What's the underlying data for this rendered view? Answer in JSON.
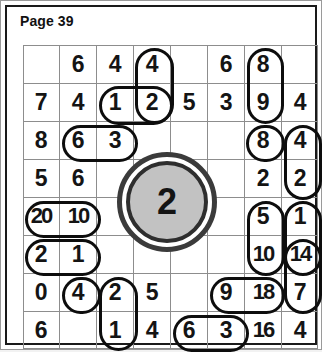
{
  "page": {
    "title": "Page 39"
  },
  "grid": {
    "rows": 8,
    "columns": 8,
    "cells": [
      [
        "",
        "6",
        "4",
        "4",
        "",
        "6",
        "8",
        ""
      ],
      [
        "7",
        "4",
        "1",
        "2",
        "5",
        "3",
        "9",
        "4"
      ],
      [
        "8",
        "6",
        "3",
        "",
        "",
        "",
        "8",
        "4"
      ],
      [
        "5",
        "6",
        "",
        "",
        "",
        "",
        "2",
        "2"
      ],
      [
        "20",
        "10",
        "",
        "",
        "",
        "",
        "5",
        "1"
      ],
      [
        "2",
        "1",
        "",
        "",
        "",
        "",
        "10",
        "14"
      ],
      [
        "0",
        "4",
        "2",
        "5",
        "",
        "9",
        "18",
        "7"
      ],
      [
        "6",
        "",
        "1",
        "4",
        "6",
        "3",
        "16",
        "4"
      ]
    ]
  },
  "annotations": {
    "circled_groups": [
      {
        "name": "group-r1c4-r2c4-vertical",
        "value": "4,2"
      },
      {
        "name": "group-r2c3-r2c4-horizontal",
        "value": "1,2"
      },
      {
        "name": "group-r1c6-r2c6-vertical",
        "value": "6,3"
      },
      {
        "name": "group-r3c2-r3c3-horizontal",
        "value": "6,3"
      },
      {
        "name": "group-r3c7-single",
        "value": "8"
      },
      {
        "name": "group-r3c8-r4c8-vertical",
        "value": "4,2"
      },
      {
        "name": "group-r5c1-r5c2-horizontal",
        "value": "20,10"
      },
      {
        "name": "group-r6c1-r6c2-horizontal",
        "value": "2,1"
      },
      {
        "name": "group-r5c7-r6c7-vertical",
        "value": "5,10"
      },
      {
        "name": "group-r5c8-r6c8-vertical",
        "value": "1,14"
      },
      {
        "name": "group-r7c2-single",
        "value": "4"
      },
      {
        "name": "group-r7c3-r8c3-vertical",
        "value": "2,1"
      },
      {
        "name": "group-r7c6-r7c7-horizontal",
        "value": "9,18"
      },
      {
        "name": "group-r6c8-r7c8-vertical",
        "value": "14,7"
      },
      {
        "name": "group-r8c5-r8c6-horizontal",
        "value": "6,3"
      }
    ],
    "highlight_disc": {
      "name": "center-disc",
      "value": "2",
      "fill_color": "#c2c2c2",
      "ring_color": "#2e2e2e"
    }
  }
}
